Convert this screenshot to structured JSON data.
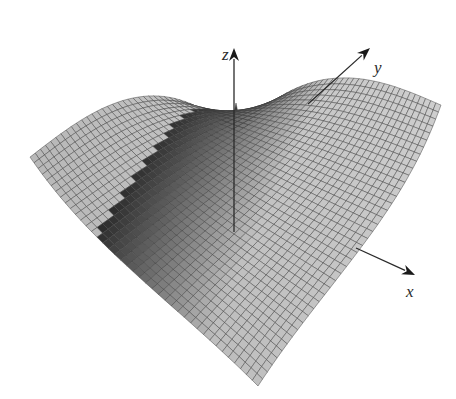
{
  "figure": {
    "type": "3d-surface-mesh",
    "background": "#ffffff",
    "mesh_stroke": "#3c3c3c",
    "fill_light": "#c9c9c9",
    "fill_dark": "#1e1e1e"
  },
  "axes": {
    "z": {
      "label": "z",
      "origin": [
        234,
        232
      ],
      "tip": [
        234,
        48
      ],
      "label_pos": [
        222,
        60
      ]
    },
    "y": {
      "label": "y",
      "origin": [
        308,
        104
      ],
      "tip": [
        370,
        48
      ],
      "label_pos": [
        374,
        73
      ]
    },
    "x": {
      "label": "x",
      "origin": [
        356,
        248
      ],
      "tip": [
        415,
        275
      ],
      "label_pos": [
        406,
        297
      ]
    }
  },
  "surface": {
    "grid_n": 40,
    "corners": {
      "left": [
        30,
        157
      ],
      "back": [
        236,
        103
      ],
      "right": [
        441,
        105
      ],
      "front": [
        258,
        386
      ]
    }
  },
  "chart_data": {
    "type": "surface",
    "title": "",
    "xlabel": "x",
    "ylabel": "y",
    "zlabel": "z",
    "grid": "mesh",
    "legend": null
  }
}
